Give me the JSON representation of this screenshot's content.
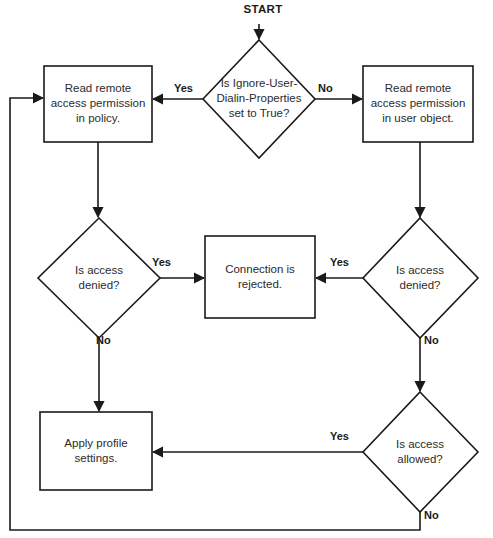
{
  "diagram": {
    "start_label": "START",
    "colors": {
      "stroke": "#1a1a1a",
      "text": "#2b2b2b",
      "label": "#1a1a1a",
      "background": "#ffffff"
    },
    "nodes": [
      {
        "id": "start",
        "type": "start-label",
        "text": "START",
        "x": 259,
        "y": 10
      },
      {
        "id": "decision-ignore-user-dialin",
        "type": "decision",
        "text": "Is Ignore-User-\nDialin-Properties\nset to True?",
        "cx": 259,
        "cy": 99,
        "w": 112,
        "h": 118
      },
      {
        "id": "process-read-policy",
        "type": "process",
        "text": "Read remote\naccess permission\nin policy.",
        "x": 44,
        "y": 66,
        "w": 108,
        "h": 76
      },
      {
        "id": "process-read-user-object",
        "type": "process",
        "text": "Read remote\naccess permission\nin user object.",
        "x": 363,
        "y": 66,
        "w": 110,
        "h": 76
      },
      {
        "id": "decision-access-denied-policy",
        "type": "decision",
        "text": "Is access\ndenied?",
        "cx": 99,
        "cy": 278,
        "w": 122,
        "h": 120
      },
      {
        "id": "process-connection-rejected",
        "type": "process",
        "text": "Connection is\nrejected.",
        "x": 205,
        "y": 236,
        "w": 110,
        "h": 82
      },
      {
        "id": "decision-access-denied-user",
        "type": "decision",
        "text": "Is access\ndenied?",
        "cx": 420,
        "cy": 278,
        "w": 115,
        "h": 120
      },
      {
        "id": "decision-access-allowed",
        "type": "decision",
        "text": "Is access\nallowed?",
        "cx": 420,
        "cy": 452,
        "w": 115,
        "h": 120
      },
      {
        "id": "process-apply-profile",
        "type": "process",
        "text": "Apply profile\nsettings.",
        "x": 40,
        "y": 412,
        "w": 112,
        "h": 78
      }
    ],
    "edge_labels": [
      {
        "id": "yes-ignore-dialin",
        "text": "Yes",
        "x": 174,
        "y": 84
      },
      {
        "id": "no-ignore-dialin",
        "text": "No",
        "x": 318,
        "y": 84
      },
      {
        "id": "yes-denied-policy",
        "text": "Yes",
        "x": 152,
        "y": 258
      },
      {
        "id": "no-denied-policy",
        "text": "No",
        "x": 95,
        "y": 336
      },
      {
        "id": "yes-denied-user",
        "text": "Yes",
        "x": 330,
        "y": 258
      },
      {
        "id": "no-denied-user",
        "text": "No",
        "x": 424,
        "y": 336
      },
      {
        "id": "yes-access-allowed",
        "text": "Yes",
        "x": 330,
        "y": 432
      },
      {
        "id": "no-access-allowed",
        "text": "No",
        "x": 424,
        "y": 511
      }
    ]
  }
}
